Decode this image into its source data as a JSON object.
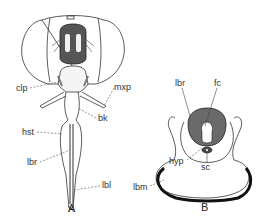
{
  "figure_A": {
    "caption": "A",
    "labels": {
      "clp": "clp",
      "mxp": "mxp",
      "bk": "bk",
      "hst": "hst",
      "lbr": "lbr",
      "lbl": "lbl"
    }
  },
  "figure_B": {
    "caption": "B",
    "labels": {
      "lbr": "lbr",
      "fc": "fc",
      "hyp": "hyp",
      "sc": "sc",
      "lbm": "lbm"
    }
  },
  "colors": {
    "line": "#333333",
    "shade": "#6a6a6a",
    "background": "#ffffff"
  }
}
